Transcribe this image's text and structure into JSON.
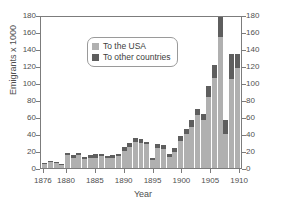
{
  "chart_data": {
    "type": "bar",
    "stacked": true,
    "title": "",
    "xlabel": "Year",
    "ylabel": "Emigrants x 1000",
    "ylim": [
      0,
      180
    ],
    "ytick_step": 20,
    "yticks": [
      0,
      20,
      40,
      60,
      80,
      100,
      120,
      140,
      160,
      180
    ],
    "yticks_right": [
      0,
      20,
      40,
      60,
      80,
      100,
      120,
      140,
      160,
      180
    ],
    "right_axis_mirrors_left": true,
    "grid": false,
    "legend_position": "top-left",
    "categories": [
      1876,
      1877,
      1878,
      1879,
      1880,
      1881,
      1882,
      1883,
      1884,
      1885,
      1886,
      1887,
      1888,
      1889,
      1890,
      1891,
      1892,
      1893,
      1894,
      1895,
      1896,
      1897,
      1898,
      1899,
      1900,
      1901,
      1902,
      1903,
      1904,
      1905,
      1906,
      1907,
      1908,
      1909,
      1910
    ],
    "xtick_labels": [
      "1876",
      "1880",
      "1885",
      "1890",
      "1895",
      "1900",
      "1905",
      "1910"
    ],
    "xtick_values": [
      1876,
      1880,
      1885,
      1890,
      1895,
      1900,
      1905,
      1910
    ],
    "series": [
      {
        "name": "To the USA",
        "color": "#b0b0b0",
        "values": [
          5,
          7,
          6,
          4,
          15,
          12,
          15,
          11,
          12,
          12,
          14,
          12,
          12,
          14,
          20,
          25,
          31,
          30,
          28,
          10,
          23,
          22,
          13,
          19,
          32,
          40,
          48,
          62,
          56,
          84,
          106,
          155,
          40,
          105,
          118
        ]
      },
      {
        "name": "To other countries",
        "color": "#5e5e5e",
        "values": [
          1,
          1,
          1,
          1,
          3,
          3,
          3,
          2,
          3,
          5,
          3,
          2,
          3,
          3,
          5,
          5,
          4,
          4,
          3,
          2,
          5,
          5,
          3,
          5,
          6,
          6,
          8,
          8,
          7,
          12,
          15,
          23,
          17,
          29,
          16
        ]
      }
    ],
    "totals": [
      6,
      8,
      7,
      5,
      18,
      15,
      18,
      13,
      15,
      17,
      17,
      14,
      15,
      17,
      25,
      30,
      35,
      34,
      31,
      12,
      28,
      27,
      16,
      24,
      38,
      46,
      56,
      70,
      63,
      96,
      121,
      178,
      57,
      134,
      134
    ]
  },
  "legend": {
    "items": [
      {
        "label": "To the USA",
        "swatch": "usa-swatch"
      },
      {
        "label": "To other countries",
        "swatch": "other-swatch"
      }
    ]
  },
  "colors": {
    "usa": "#b0b0b0",
    "other": "#5e5e5e",
    "axis": "#7c7c7c",
    "text": "#4f4f4f",
    "background": "#ffffff"
  }
}
